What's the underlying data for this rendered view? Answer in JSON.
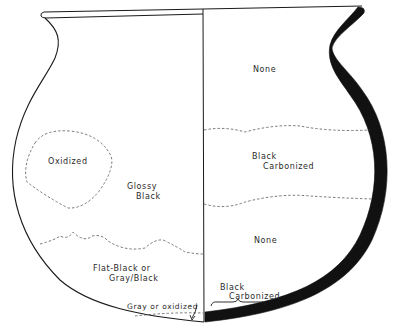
{
  "diagram": {
    "colors": {
      "line": "#1a1a1a",
      "fill_wall": "#111111",
      "dash": "#555555",
      "background": "#ffffff"
    },
    "exterior_labels": {
      "oxidized": "Oxidized",
      "glossy_black_1": "Glossy",
      "glossy_black_2": "Black",
      "flat_black_1": "Flat-Black or",
      "flat_black_2": "Gray/Black",
      "gray_oxidized": "Gray or oxidized"
    },
    "interior_labels": {
      "none_top": "None",
      "black_carbonized_mid_1": "Black",
      "black_carbonized_mid_2": "Carbonized",
      "none_lower": "None",
      "black_carbonized_base_1": "Black",
      "black_carbonized_base_2": "Carbonized"
    }
  }
}
